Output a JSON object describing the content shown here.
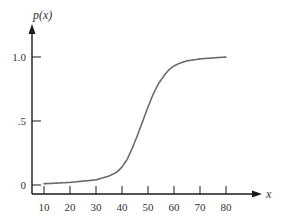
{
  "chart_data": {
    "type": "line",
    "title": "",
    "xlabel": "x",
    "ylabel": "p(x)",
    "xlim": [
      5,
      90
    ],
    "ylim": [
      0,
      1.1
    ],
    "grid": false,
    "legend": null,
    "x_ticks": [
      10,
      20,
      30,
      40,
      50,
      60,
      70,
      80
    ],
    "x_tick_labels": [
      "10",
      "20",
      "30",
      "40",
      "50",
      "60",
      "70",
      "80"
    ],
    "y_ticks": [
      0,
      0.5,
      1.0
    ],
    "y_tick_labels": [
      "0",
      ".5",
      "1.0"
    ],
    "series": [
      {
        "name": "p(x)",
        "color": "#6b6b6b",
        "x": [
          10,
          15,
          20,
          25,
          30,
          35,
          38,
          40,
          42,
          44,
          46,
          48,
          50,
          52,
          54,
          56,
          58,
          60,
          62,
          65,
          70,
          75,
          80
        ],
        "values": [
          0.01,
          0.015,
          0.02,
          0.03,
          0.04,
          0.07,
          0.1,
          0.14,
          0.2,
          0.29,
          0.39,
          0.5,
          0.61,
          0.71,
          0.79,
          0.85,
          0.9,
          0.93,
          0.95,
          0.97,
          0.985,
          0.993,
          1.0
        ]
      }
    ]
  },
  "colors": {
    "axis": "#1a1a1a",
    "curve": "#6b6b6b",
    "text": "#333333"
  }
}
